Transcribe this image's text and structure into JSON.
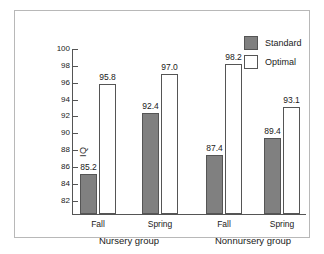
{
  "chart_data": {
    "type": "bar",
    "title": "",
    "xlabel": "",
    "ylabel": "IQ",
    "ylim": [
      80.4,
      100
    ],
    "yticks": [
      82,
      84,
      86,
      88,
      90,
      92,
      94,
      96,
      98,
      100
    ],
    "ytick_labels": [
      "82",
      "84",
      "86",
      "88",
      "90",
      "92",
      "94",
      "96",
      "98",
      "100"
    ],
    "grid": false,
    "legend_position": "top-right",
    "categories": [
      "Fall",
      "Spring",
      "Fall",
      "Spring"
    ],
    "groups": [
      {
        "name": "Nursery group",
        "categories": [
          "Fall",
          "Spring"
        ]
      },
      {
        "name": "Nonnursery group",
        "categories": [
          "Fall",
          "Spring"
        ]
      }
    ],
    "series": [
      {
        "name": "Standard",
        "color": "#808080",
        "values": [
          85.2,
          92.4,
          87.4,
          89.4
        ],
        "labels": [
          "85.2",
          "92.4",
          "87.4",
          "89.4"
        ]
      },
      {
        "name": "Optimal",
        "color": "#ffffff",
        "values": [
          95.8,
          97.0,
          98.2,
          93.1
        ],
        "labels": [
          "95.8",
          "97.0",
          "98.2",
          "93.1"
        ]
      }
    ]
  },
  "legend": {
    "items": [
      {
        "label": "Standard",
        "swatch": "filled-gray-swatch"
      },
      {
        "label": "Optimal",
        "swatch": "outlined-white-swatch"
      }
    ]
  },
  "axis": {
    "y_title": "IQ"
  }
}
